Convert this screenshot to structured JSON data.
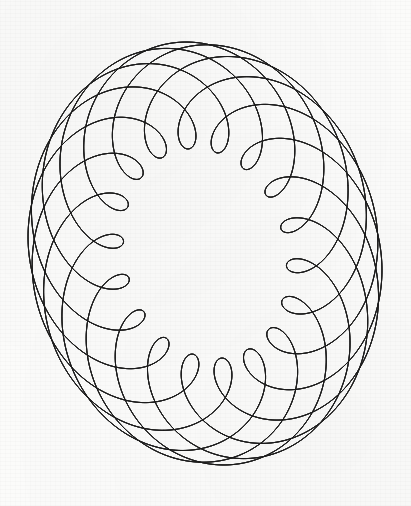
{
  "canvas": {
    "width": 411,
    "height": 506,
    "background_color": "#fbfbfa",
    "ink_color": "#1b1b1b",
    "medium": "pen-on-paper-scan"
  },
  "artwork": {
    "title": "",
    "kind": "harmonograph-envelope-figure",
    "description": "Dense family of thin curves forming a five-lobed rotationally-sweeping star with an empty central hole",
    "lobe_count": 5,
    "curve_count": 36,
    "line_width_px": 0.62
  },
  "chart_data": {
    "type": "line",
    "title": "",
    "xlabel": "",
    "ylabel": "",
    "grid": false,
    "legend": null,
    "xlim": [
      0,
      411
    ],
    "ylim": [
      0,
      506
    ],
    "parametric": {
      "model": "rotating-envelope / lissajous-harmonograph",
      "center_x": 205,
      "center_y": 253,
      "samples_per_curve": 260,
      "t_start": 0,
      "t_end": 6.283185307179586,
      "curve_count": 36,
      "phase_step": 0.17453292519943295,
      "components": [
        {
          "name": "x-major",
          "amplitude": 155,
          "frequency": 1,
          "phase": 0
        },
        {
          "name": "x-minor",
          "amplitude": 58,
          "frequency": 4,
          "phase": 0
        },
        {
          "name": "y-major",
          "amplitude": 185,
          "frequency": 1,
          "phase": 1.5707963267948966
        },
        {
          "name": "y-minor",
          "amplitude": 62,
          "frequency": 4,
          "phase": 1.5707963267948966
        }
      ]
    },
    "extrema": {
      "top_tip": [
        196,
        42
      ],
      "right_tip": [
        382,
        238
      ],
      "bottom_tip": [
        236,
        465
      ],
      "left_lower_tip": [
        28,
        385
      ],
      "upper_left_fan_start": [
        38,
        100
      ]
    },
    "nodes": [
      [
        175,
        180
      ],
      [
        250,
        210
      ],
      [
        175,
        315
      ],
      [
        246,
        312
      ]
    ],
    "central_hole": {
      "shape": "irregular-hexagon",
      "center": [
        198,
        250
      ],
      "approx_radius": 62
    }
  }
}
